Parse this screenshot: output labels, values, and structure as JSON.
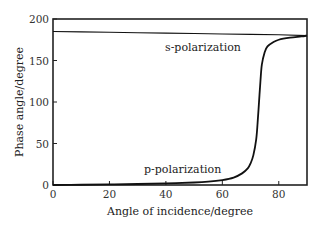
{
  "chart_data": {
    "type": "line",
    "title": "",
    "xlabel": "Angle of incidence/degree",
    "ylabel": "Phase angle/degree",
    "xlim": [
      0,
      90
    ],
    "ylim": [
      0,
      200
    ],
    "xticks": [
      0,
      20,
      40,
      60,
      80
    ],
    "yticks": [
      0,
      50,
      100,
      150,
      200
    ],
    "grid": false,
    "legend": "none (inline annotations)",
    "series": [
      {
        "name": "s-polarization",
        "x": [
          0,
          10,
          20,
          30,
          40,
          50,
          60,
          70,
          80,
          90
        ],
        "y": [
          185,
          184.5,
          184,
          183.5,
          183,
          182.5,
          182,
          181.5,
          181,
          180
        ]
      },
      {
        "name": "p-polarization",
        "x": [
          0,
          10,
          20,
          30,
          40,
          50,
          55,
          60,
          64,
          67,
          69,
          70,
          71,
          72,
          72.5,
          73,
          73.5,
          74,
          75,
          76,
          78,
          80,
          84,
          88,
          90
        ],
        "y": [
          0,
          0.3,
          0.7,
          1.2,
          2,
          3,
          4,
          6,
          9,
          14,
          20,
          26,
          36,
          55,
          75,
          100,
          125,
          145,
          160,
          167,
          172,
          175,
          177.5,
          179,
          180
        ]
      }
    ],
    "annotations": [
      {
        "text": "s-polarization",
        "x": 45,
        "y": 165
      },
      {
        "text": "p-polarization",
        "x": 40,
        "y": 22
      }
    ]
  },
  "labels": {
    "xlabel": "Angle of incidence/degree",
    "ylabel": "Phase angle/degree",
    "s_label": "s-polarization",
    "p_label": "p-polarization",
    "xtick_labels": [
      "0",
      "20",
      "40",
      "60",
      "80"
    ],
    "ytick_labels": [
      "0",
      "50",
      "100",
      "150",
      "200"
    ]
  }
}
